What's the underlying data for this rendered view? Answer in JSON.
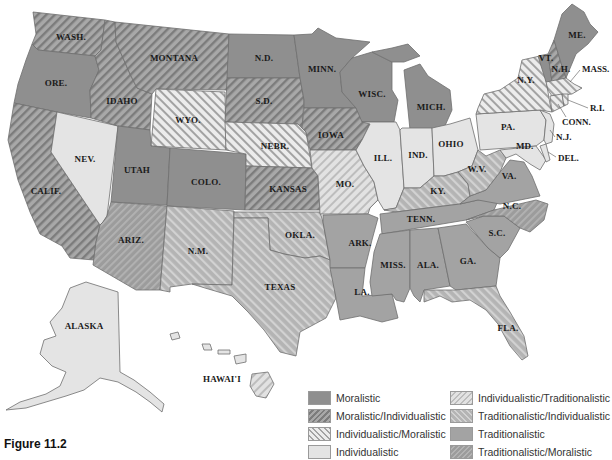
{
  "figure": {
    "caption": "Figure 11.2"
  },
  "colors": {
    "moralistic": "#8f8f8f",
    "moralistic_individualistic_base": "#a8a8a8",
    "moralistic_individualistic_stripe": "#7a7a7a",
    "individualistic_moralistic_base": "#ececec",
    "individualistic_moralistic_stripe": "#a0a0a0",
    "individualistic": "#e4e4e4",
    "individualistic_traditionalistic_base": "#dedede",
    "individualistic_traditionalistic_stripe": "#bdbdbd",
    "traditionalistic_individualistic_base": "#b6b6b6",
    "traditionalistic_individualistic_stripe": "#d6d6d6",
    "traditionalistic": "#a3a3a3",
    "traditionalistic_moralistic_base": "#9c9c9c",
    "traditionalistic_moralistic_stripe": "#b4b4b4",
    "border": "#6e6e6e",
    "label": "#1a1a1a"
  },
  "legend": {
    "items": [
      {
        "key": "moralistic",
        "label": "Moralistic"
      },
      {
        "key": "moralistic_individualistic",
        "label": "Moralistic/Individualistic"
      },
      {
        "key": "individualistic_moralistic",
        "label": "Individualistic/Moralistic"
      },
      {
        "key": "individualistic",
        "label": "Individualistic"
      },
      {
        "key": "individualistic_traditionalistic",
        "label": "Individualistic/Traditionalistic"
      },
      {
        "key": "traditionalistic_individualistic",
        "label": "Traditionalistic/Individualistic"
      },
      {
        "key": "traditionalistic",
        "label": "Traditionalistic"
      },
      {
        "key": "traditionalistic_moralistic",
        "label": "Traditionalistic/Moralistic"
      }
    ]
  },
  "states": {
    "wash": {
      "label": "WASH.",
      "category": "moralistic_individualistic"
    },
    "ore": {
      "label": "ORE.",
      "category": "moralistic"
    },
    "calif": {
      "label": "CALIF.",
      "category": "moralistic_individualistic"
    },
    "nev": {
      "label": "NEV.",
      "category": "individualistic"
    },
    "idaho": {
      "label": "IDAHO",
      "category": "moralistic_individualistic"
    },
    "montana": {
      "label": "MONTANA",
      "category": "moralistic_individualistic"
    },
    "wyo": {
      "label": "WYO.",
      "category": "individualistic_moralistic"
    },
    "utah": {
      "label": "UTAH",
      "category": "moralistic"
    },
    "colo": {
      "label": "COLO.",
      "category": "moralistic"
    },
    "ariz": {
      "label": "ARIZ.",
      "category": "traditionalistic_moralistic"
    },
    "nm": {
      "label": "N.M.",
      "category": "traditionalistic_individualistic"
    },
    "nd": {
      "label": "N.D.",
      "category": "moralistic"
    },
    "sd": {
      "label": "S.D.",
      "category": "moralistic_individualistic"
    },
    "nebr": {
      "label": "NEBR.",
      "category": "individualistic_moralistic"
    },
    "kansas": {
      "label": "KANSAS",
      "category": "moralistic_individualistic"
    },
    "okla": {
      "label": "OKLA.",
      "category": "traditionalistic_individualistic"
    },
    "texas": {
      "label": "TEXAS",
      "category": "traditionalistic_individualistic"
    },
    "minn": {
      "label": "MINN.",
      "category": "moralistic"
    },
    "iowa": {
      "label": "IOWA",
      "category": "moralistic_individualistic"
    },
    "mo": {
      "label": "MO.",
      "category": "individualistic_traditionalistic"
    },
    "ark": {
      "label": "ARK.",
      "category": "traditionalistic"
    },
    "la": {
      "label": "LA.",
      "category": "traditionalistic"
    },
    "wisc": {
      "label": "WISC.",
      "category": "moralistic"
    },
    "ill": {
      "label": "ILL.",
      "category": "individualistic"
    },
    "mich": {
      "label": "MICH.",
      "category": "moralistic"
    },
    "ind": {
      "label": "IND.",
      "category": "individualistic"
    },
    "ohio": {
      "label": "OHIO",
      "category": "individualistic"
    },
    "ky": {
      "label": "KY.",
      "category": "traditionalistic_individualistic"
    },
    "tenn": {
      "label": "TENN.",
      "category": "traditionalistic"
    },
    "miss": {
      "label": "MISS.",
      "category": "traditionalistic"
    },
    "ala": {
      "label": "ALA.",
      "category": "traditionalistic"
    },
    "ga": {
      "label": "GA.",
      "category": "traditionalistic"
    },
    "fla": {
      "label": "FLA.",
      "category": "traditionalistic_individualistic"
    },
    "sc": {
      "label": "S.C.",
      "category": "traditionalistic"
    },
    "nc": {
      "label": "N.C.",
      "category": "traditionalistic_moralistic"
    },
    "va": {
      "label": "VA.",
      "category": "traditionalistic"
    },
    "wv": {
      "label": "W.V.",
      "category": "traditionalistic_individualistic"
    },
    "md": {
      "label": "MD.",
      "category": "individualistic"
    },
    "del": {
      "label": "DEL.",
      "category": "individualistic"
    },
    "nj": {
      "label": "N.J.",
      "category": "individualistic"
    },
    "pa": {
      "label": "PA.",
      "category": "individualistic"
    },
    "ny": {
      "label": "N.Y.",
      "category": "individualistic_moralistic"
    },
    "conn": {
      "label": "CONN.",
      "category": "individualistic_moralistic"
    },
    "ri": {
      "label": "R.I.",
      "category": "individualistic_moralistic"
    },
    "mass": {
      "label": "MASS.",
      "category": "individualistic_moralistic"
    },
    "vt": {
      "label": "VT.",
      "category": "moralistic"
    },
    "nh": {
      "label": "N.H.",
      "category": "moralistic_individualistic"
    },
    "me": {
      "label": "ME.",
      "category": "moralistic"
    },
    "alaska": {
      "label": "ALASKA",
      "category": "individualistic"
    },
    "hawaii": {
      "label": "HAWAI'I",
      "category": "individualistic_traditionalistic"
    }
  }
}
